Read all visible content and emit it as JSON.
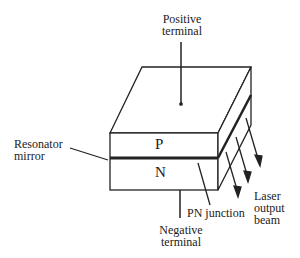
{
  "diagram": {
    "type": "semiconductor laser diode",
    "labels": {
      "positive_terminal": [
        "Positive",
        "terminal"
      ],
      "resonator_mirror": [
        "Resonator",
        "mirror"
      ],
      "p_region": "P",
      "n_region": "N",
      "pn_junction": "PN junction",
      "laser_output_beam": [
        "Laser",
        "output",
        "beam"
      ],
      "negative_terminal": [
        "Negative",
        "terminal"
      ]
    }
  }
}
